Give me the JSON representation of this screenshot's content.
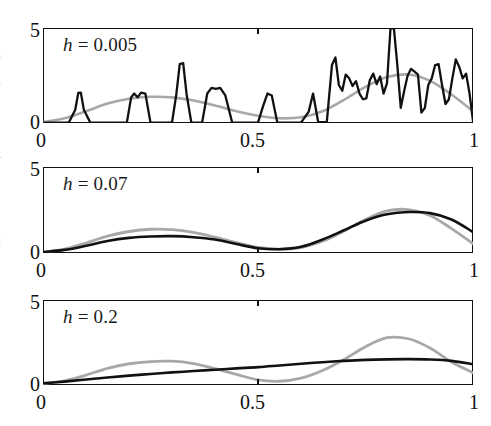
{
  "figure": {
    "kind": "kde-bandwidth-comparison",
    "n_panels": 3,
    "margin_text_fragments": [
      "l",
      "d",
      "n",
      "a",
      "t",
      "y",
      "t",
      "l",
      "n",
      "e",
      "-",
      "-"
    ]
  },
  "axes": {
    "y_ticks": [
      "0",
      "5"
    ],
    "x_ticks": [
      "0",
      "0.5",
      "1"
    ],
    "ylim": [
      0,
      5
    ],
    "xlim": [
      0,
      1
    ]
  },
  "panels": [
    {
      "id": "panel-h-0005",
      "label_var": "h",
      "label_eq": "=",
      "label_value": "0.005",
      "label_full": "h = 0.005",
      "bandwidth": 0.005
    },
    {
      "id": "panel-h-007",
      "label_var": "h",
      "label_eq": "=",
      "label_value": "0.07",
      "label_full": "h = 0.07",
      "bandwidth": 0.07
    },
    {
      "id": "panel-h-02",
      "label_var": "h",
      "label_eq": "=",
      "label_value": "0.2",
      "label_full": "h = 0.2",
      "bandwidth": 0.2
    }
  ],
  "colors": {
    "estimate": "#111111",
    "truth": "#a8a8a8",
    "axis": "#111111",
    "background": "#ffffff"
  },
  "chart_data": {
    "type": "line",
    "title": "",
    "xlabel": "",
    "ylabel": "",
    "xlim": [
      0,
      1
    ],
    "ylim": [
      0,
      5
    ],
    "grid": false,
    "legend": "none",
    "subplots": [
      {
        "name": "h = 0.005",
        "series": [
          {
            "name": "true density",
            "color": "#a8a8a8",
            "x": [
              0.0,
              0.05,
              0.1,
              0.15,
              0.2,
              0.25,
              0.3,
              0.35,
              0.4,
              0.45,
              0.5,
              0.55,
              0.6,
              0.65,
              0.7,
              0.75,
              0.8,
              0.85,
              0.9,
              0.95,
              1.0
            ],
            "values": [
              0.05,
              0.25,
              0.62,
              1.02,
              1.28,
              1.38,
              1.35,
              1.18,
              0.92,
              0.62,
              0.38,
              0.25,
              0.3,
              0.62,
              1.22,
              1.9,
              2.42,
              2.55,
              2.22,
              1.5,
              0.62
            ]
          },
          {
            "name": "kernel density estimate",
            "color": "#111111",
            "x": [
              0.0,
              0.06,
              0.075,
              0.082,
              0.088,
              0.095,
              0.11,
              0.195,
              0.205,
              0.212,
              0.22,
              0.228,
              0.238,
              0.25,
              0.3,
              0.31,
              0.318,
              0.326,
              0.334,
              0.345,
              0.37,
              0.382,
              0.392,
              0.402,
              0.412,
              0.424,
              0.44,
              0.5,
              0.512,
              0.522,
              0.532,
              0.545,
              0.6,
              0.618,
              0.628,
              0.64,
              0.66,
              0.672,
              0.68,
              0.688,
              0.696,
              0.704,
              0.712,
              0.72,
              0.728,
              0.736,
              0.744,
              0.752,
              0.76,
              0.768,
              0.776,
              0.784,
              0.792,
              0.8,
              0.808,
              0.816,
              0.824,
              0.832,
              0.84,
              0.848,
              0.856,
              0.864,
              0.872,
              0.88,
              0.888,
              0.896,
              0.904,
              0.912,
              0.92,
              0.928,
              0.936,
              0.944,
              0.952,
              0.96,
              0.968,
              0.976,
              0.984,
              0.992,
              1.0
            ],
            "values": [
              0.02,
              0.02,
              0.7,
              1.58,
              1.6,
              0.7,
              0.02,
              0.02,
              1.35,
              1.55,
              1.35,
              1.6,
              1.55,
              0.02,
              0.02,
              1.5,
              3.1,
              3.15,
              1.5,
              0.02,
              0.02,
              1.55,
              1.85,
              1.8,
              1.85,
              1.45,
              0.02,
              0.02,
              0.9,
              1.55,
              1.45,
              0.02,
              0.02,
              0.6,
              1.55,
              0.05,
              0.05,
              3.05,
              3.45,
              2.0,
              1.7,
              2.55,
              2.35,
              1.95,
              2.2,
              1.55,
              1.25,
              1.3,
              2.25,
              2.6,
              2.05,
              2.45,
              1.55,
              2.1,
              4.95,
              5.0,
              3.05,
              0.8,
              1.7,
              2.5,
              2.85,
              2.7,
              2.55,
              0.55,
              0.8,
              2.0,
              2.35,
              3.05,
              3.1,
              2.0,
              1.0,
              1.25,
              2.35,
              3.35,
              2.95,
              2.35,
              2.6,
              1.55,
              0.1
            ]
          }
        ]
      },
      {
        "name": "h = 0.07",
        "series": [
          {
            "name": "true density",
            "color": "#a8a8a8",
            "x": [
              0.0,
              0.05,
              0.1,
              0.15,
              0.2,
              0.25,
              0.3,
              0.35,
              0.4,
              0.45,
              0.5,
              0.55,
              0.6,
              0.65,
              0.7,
              0.75,
              0.8,
              0.85,
              0.9,
              0.95,
              1.0
            ],
            "values": [
              0.05,
              0.22,
              0.58,
              0.98,
              1.25,
              1.38,
              1.36,
              1.2,
              0.92,
              0.6,
              0.32,
              0.22,
              0.32,
              0.68,
              1.28,
              1.95,
              2.45,
              2.52,
              2.18,
              1.42,
              0.55
            ]
          },
          {
            "name": "kernel density estimate",
            "color": "#111111",
            "x": [
              0.0,
              0.05,
              0.1,
              0.15,
              0.2,
              0.25,
              0.3,
              0.35,
              0.4,
              0.45,
              0.5,
              0.55,
              0.6,
              0.65,
              0.7,
              0.75,
              0.8,
              0.85,
              0.9,
              0.95,
              1.0
            ],
            "values": [
              0.05,
              0.18,
              0.42,
              0.7,
              0.88,
              0.96,
              0.98,
              0.92,
              0.78,
              0.52,
              0.28,
              0.22,
              0.36,
              0.78,
              1.32,
              1.88,
              2.25,
              2.38,
              2.32,
              1.95,
              1.22
            ]
          }
        ]
      },
      {
        "name": "h = 0.2",
        "series": [
          {
            "name": "true density",
            "color": "#a8a8a8",
            "x": [
              0.0,
              0.05,
              0.1,
              0.15,
              0.2,
              0.25,
              0.3,
              0.35,
              0.4,
              0.45,
              0.5,
              0.55,
              0.6,
              0.65,
              0.7,
              0.75,
              0.8,
              0.85,
              0.9,
              0.95,
              1.0
            ],
            "values": [
              0.08,
              0.25,
              0.58,
              0.98,
              1.25,
              1.38,
              1.4,
              1.26,
              0.96,
              0.62,
              0.3,
              0.22,
              0.4,
              0.85,
              1.5,
              2.25,
              2.78,
              2.72,
              2.18,
              1.35,
              0.72
            ]
          },
          {
            "name": "kernel density estimate",
            "color": "#111111",
            "x": [
              0.0,
              0.05,
              0.1,
              0.15,
              0.2,
              0.25,
              0.3,
              0.35,
              0.4,
              0.45,
              0.5,
              0.55,
              0.6,
              0.65,
              0.7,
              0.75,
              0.8,
              0.85,
              0.9,
              0.95,
              1.0
            ],
            "values": [
              0.1,
              0.2,
              0.32,
              0.44,
              0.55,
              0.65,
              0.74,
              0.82,
              0.9,
              0.98,
              1.05,
              1.15,
              1.25,
              1.34,
              1.42,
              1.48,
              1.51,
              1.52,
              1.5,
              1.42,
              1.22
            ]
          }
        ]
      }
    ]
  }
}
